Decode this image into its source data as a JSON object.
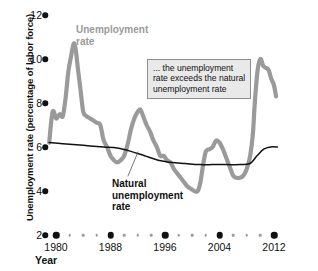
{
  "chart_data": {
    "type": "line",
    "title": "",
    "xlabel": "Year",
    "ylabel": "Unemployment rate (percentage of labor force)",
    "xlim": [
      1979,
      2013
    ],
    "ylim": [
      2,
      12
    ],
    "grid": false,
    "legend_position": "inline-labels",
    "y_ticks": [
      12,
      10,
      8,
      6,
      4,
      2
    ],
    "x_ticks": [
      1980,
      1988,
      1996,
      2004,
      2012
    ],
    "x_minor_ticks": [
      1982,
      1984,
      1986,
      1990,
      1992,
      1994,
      1998,
      2000,
      2002,
      2006,
      2008,
      2010
    ],
    "series": [
      {
        "name": "Unemployment rate",
        "color": "#9a9a9a",
        "x": [
          1979.0,
          1979.5,
          1980.0,
          1980.3,
          1980.6,
          1981.0,
          1981.4,
          1981.8,
          1982.2,
          1982.6,
          1982.9,
          1983.2,
          1983.6,
          1984.0,
          1984.5,
          1985.0,
          1985.5,
          1986.0,
          1986.5,
          1987.0,
          1987.5,
          1988.0,
          1988.5,
          1989.0,
          1989.5,
          1990.0,
          1990.5,
          1991.0,
          1991.5,
          1992.0,
          1992.4,
          1992.8,
          1993.3,
          1993.8,
          1994.3,
          1994.8,
          1995.3,
          1995.8,
          1996.3,
          1996.8,
          1997.3,
          1997.8,
          1998.3,
          1998.8,
          1999.3,
          1999.8,
          2000.3,
          2000.8,
          2001.2,
          2001.6,
          2002.0,
          2002.5,
          2003.0,
          2003.5,
          2004.0,
          2004.5,
          2005.0,
          2005.5,
          2006.0,
          2006.5,
          2007.0,
          2007.5,
          2008.0,
          2008.5,
          2008.9,
          2009.2,
          2009.6,
          2010.0,
          2010.4,
          2010.8,
          2011.2,
          2011.6,
          2012.0,
          2012.3
        ],
        "y": [
          6.2,
          7.6,
          7.3,
          7.4,
          7.5,
          7.4,
          8.2,
          9.4,
          10.1,
          10.7,
          10.4,
          9.6,
          8.6,
          7.6,
          7.4,
          7.3,
          7.2,
          7.1,
          7.0,
          6.3,
          6.0,
          5.6,
          5.4,
          5.3,
          5.4,
          5.6,
          6.1,
          6.8,
          7.3,
          7.6,
          7.7,
          7.4,
          7.0,
          6.7,
          6.3,
          6.0,
          5.6,
          5.6,
          5.4,
          5.3,
          5.0,
          4.8,
          4.6,
          4.4,
          4.2,
          4.1,
          4.0,
          4.0,
          4.4,
          5.2,
          5.8,
          5.9,
          6.0,
          6.3,
          6.2,
          5.9,
          5.5,
          5.1,
          4.7,
          4.6,
          4.6,
          4.7,
          5.0,
          5.6,
          6.6,
          8.1,
          9.5,
          10.0,
          9.7,
          9.6,
          9.5,
          9.1,
          8.8,
          8.3
        ],
        "peaks": [
          {
            "year": 1982.6,
            "value": 10.7
          },
          {
            "year": 1992.4,
            "value": 7.7
          },
          {
            "year": 2003.5,
            "value": 6.3
          },
          {
            "year": 2010.0,
            "value": 10.0
          }
        ],
        "troughs": [
          {
            "year": 1988.5,
            "value": 5.4
          },
          {
            "year": 2000.3,
            "value": 4.0
          },
          {
            "year": 2006.5,
            "value": 4.6
          }
        ]
      },
      {
        "name": "Natural unemployment rate",
        "color": "#111111",
        "x": [
          1979.0,
          1981.0,
          1983.0,
          1985.0,
          1987.0,
          1989.0,
          1991.0,
          1993.0,
          1995.0,
          1997.0,
          1999.0,
          2001.0,
          2003.0,
          2005.0,
          2007.0,
          2008.5,
          2009.5,
          2010.5,
          2011.5,
          2012.5
        ],
        "y": [
          6.2,
          6.15,
          6.1,
          6.05,
          6.0,
          5.95,
          5.8,
          5.6,
          5.4,
          5.3,
          5.25,
          5.2,
          5.2,
          5.2,
          5.2,
          5.25,
          5.6,
          5.9,
          6.0,
          6.0
        ]
      }
    ],
    "annotations": [
      {
        "name": "callout",
        "text": "... the unemployment rate exceeds the natural unemployment rate"
      }
    ]
  },
  "axes": {
    "y_title": "Unemployment rate (percentage of labor force)",
    "x_title": "Year",
    "y_tick_labels": [
      "12",
      "10",
      "8",
      "6",
      "4",
      "2"
    ],
    "x_tick_labels": [
      "1980",
      "1988",
      "1996",
      "2004",
      "2012"
    ]
  },
  "labels": {
    "unemployment_rate": "Unemployment rate",
    "natural_rate": "Natural unemployment rate",
    "unemployment_rate_line1": "Unemployment",
    "unemployment_rate_line2": "rate",
    "natural_rate_line1": "Natural",
    "natural_rate_line2": "unemployment",
    "natural_rate_line3": "rate"
  },
  "annotation": {
    "text": "... the unemployment rate exceeds the natural unemployment rate"
  },
  "colors": {
    "unemployment_series": "#9a9a9a",
    "natural_series": "#111111",
    "annotation_fill": "#e9e9e9",
    "annotation_border": "#8d8d8d",
    "axis": "#111111"
  }
}
